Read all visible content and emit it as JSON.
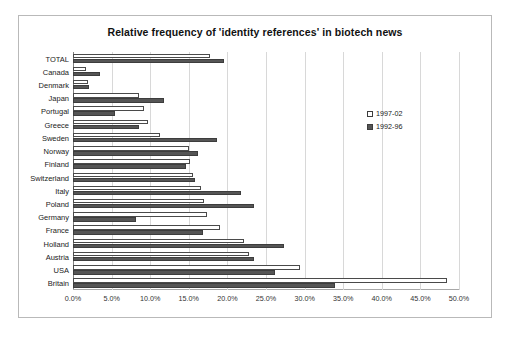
{
  "chart_data": {
    "type": "bar",
    "orientation": "horizontal",
    "title": "Relative frequency of 'identity references' in biotech news",
    "xlabel": "",
    "ylabel": "",
    "xlim": [
      0,
      50
    ],
    "xtick_labels": [
      "0.0%",
      "5.0%",
      "10.0%",
      "15.0%",
      "20.0%",
      "25.0%",
      "30.0%",
      "35.0%",
      "40.0%",
      "45.0%",
      "50.0%"
    ],
    "xtick_values": [
      0,
      5,
      10,
      15,
      20,
      25,
      30,
      35,
      40,
      45,
      50
    ],
    "grid": true,
    "legend_position": "right",
    "categories": [
      "TOTAL",
      "Canada",
      "Denmark",
      "Japan",
      "Portugal",
      "Greece",
      "Sweden",
      "Norway",
      "Finland",
      "Switzerland",
      "Italy",
      "Poland",
      "Germany",
      "France",
      "Holland",
      "Austria",
      "USA",
      "Britain"
    ],
    "series": [
      {
        "name": "1997-02",
        "color": "#ffffff",
        "values": [
          17.8,
          1.7,
          1.9,
          8.5,
          9.2,
          9.7,
          11.3,
          15.0,
          15.2,
          15.6,
          16.6,
          17.0,
          17.4,
          19.0,
          22.2,
          22.8,
          29.4,
          48.4
        ]
      },
      {
        "name": "1992-96",
        "color": "#555555",
        "values": [
          19.6,
          3.5,
          2.1,
          11.8,
          5.5,
          8.6,
          18.6,
          16.2,
          14.7,
          15.8,
          21.7,
          23.5,
          8.2,
          16.8,
          27.3,
          23.4,
          26.2,
          33.9
        ]
      }
    ]
  },
  "legend": {
    "items": [
      {
        "label": "1997-02",
        "swatch": "hollow-square-icon"
      },
      {
        "label": "1992-96",
        "swatch": "filled-square-icon"
      }
    ]
  }
}
